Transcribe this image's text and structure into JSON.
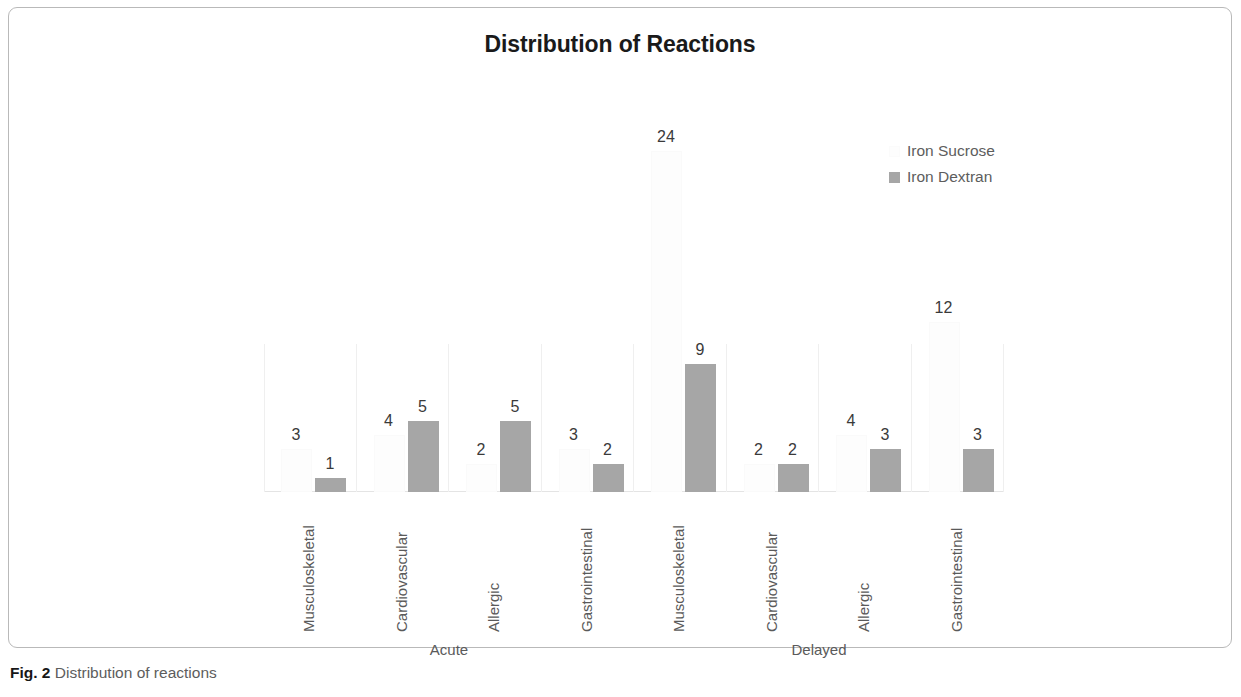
{
  "chart_data": {
    "type": "bar",
    "title": "Distribution of Reactions",
    "xlabel": "",
    "ylabel": "",
    "grid": false,
    "legend_position": "top-right",
    "ylim": [
      0,
      25
    ],
    "categories": [
      "Musculoskeletal",
      "Cardiovascular",
      "Allergic",
      "Gastrointestinal",
      "Musculoskeletal",
      "Cardiovascular",
      "Allergic",
      "Gastrointestinal"
    ],
    "outer_groups": [
      {
        "label": "Acute",
        "span": 4
      },
      {
        "label": "Delayed",
        "span": 4
      }
    ],
    "series": [
      {
        "name": "Iron Sucrose",
        "color": "#FDFDFD",
        "values": [
          3,
          4,
          2,
          3,
          24,
          2,
          4,
          12
        ]
      },
      {
        "name": "Iron Dextran",
        "color": "#A6A6A6",
        "values": [
          1,
          5,
          5,
          2,
          9,
          2,
          3,
          3
        ]
      }
    ]
  },
  "legend": {
    "items": [
      {
        "label": "Iron Sucrose",
        "swatch": "sucrose"
      },
      {
        "label": "Iron Dextran",
        "swatch": "dextran"
      }
    ]
  },
  "caption": {
    "prefix": "Fig. 2",
    "text": "Distribution of reactions"
  }
}
